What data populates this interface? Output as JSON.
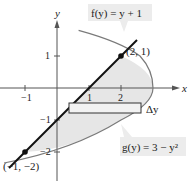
{
  "diagram": {
    "type": "area-between-curves",
    "axes": {
      "x_label": "x",
      "y_label": "y",
      "x_ticks": [
        {
          "value": -1,
          "label": "−1"
        },
        {
          "value": 1,
          "label": "1"
        },
        {
          "value": 2,
          "label": "2"
        }
      ],
      "y_ticks": [
        {
          "value": 1,
          "label": "1"
        },
        {
          "value": -1,
          "label": "−1"
        },
        {
          "value": -2,
          "label": "−2"
        }
      ]
    },
    "curves": {
      "line": {
        "label": "f(y) = y + 1",
        "equation": "x = y + 1",
        "color": "#111111"
      },
      "parabola": {
        "label": "g(y) = 3 − y²",
        "equation": "x = 3 - y^2",
        "color": "#7a7a7a"
      }
    },
    "points": [
      {
        "x": 2,
        "y": 1,
        "label": "(2, 1)"
      },
      {
        "x": -1,
        "y": -2,
        "label": "(−1, −2)"
      }
    ],
    "rectangle": {
      "label": "Δy"
    },
    "colors": {
      "shade": "#e6e6e6",
      "label_box": "#ececec",
      "axis": "#555555"
    }
  }
}
